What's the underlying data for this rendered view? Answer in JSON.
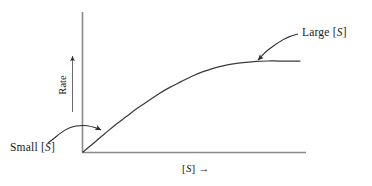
{
  "figure": {
    "name": "enzyme-kinetics-saturation-curve",
    "background_color": "#ffffff",
    "ink_color": "#3a3a3a",
    "text_color": "#1a1a1a"
  },
  "labels": {
    "y_axis": "Rate",
    "y_axis_arrow": "↑",
    "x_axis_prefix": "[",
    "x_axis_var": "S",
    "x_axis_suffix": "]",
    "x_axis_arrow": "→",
    "x_axis_full": "[S] →",
    "small_s": "Small [S]",
    "small_s_prefix": "Small  [",
    "small_s_var": "S",
    "small_s_suffix": "]",
    "large_s": "Large [S]",
    "large_s_prefix": "Large  [",
    "large_s_var": "S",
    "large_s_suffix": "]"
  },
  "annotations": [
    {
      "name": "small-s-annotation",
      "text": "Small [S]",
      "points_to": "initial linear region of curve near origin",
      "arrow_direction": "curves up and to the right"
    },
    {
      "name": "large-s-annotation",
      "text": "Large [S]",
      "points_to": "plateau region of curve at high substrate concentration",
      "arrow_direction": "curves down and to the left"
    }
  ],
  "chart_data": {
    "type": "line",
    "title": "",
    "subtitle": "",
    "xlabel": "[S] →",
    "ylabel": "Rate",
    "grid": false,
    "legend": false,
    "legend_position": "none",
    "axis_ticks": false,
    "axis_tick_labels": false,
    "xlim": [
      0,
      1
    ],
    "ylim": [
      0,
      1
    ],
    "series": [
      {
        "name": "Rate vs [S]",
        "color": "#3a3a3a",
        "x": [
          0.0,
          0.05,
          0.1,
          0.15,
          0.2,
          0.25,
          0.3,
          0.35,
          0.4,
          0.45,
          0.5,
          0.55,
          0.6,
          0.65,
          0.7,
          0.75,
          0.8,
          0.85,
          0.9,
          0.95,
          1.0
        ],
        "y": [
          0.0,
          0.1,
          0.2,
          0.3,
          0.39,
          0.48,
          0.56,
          0.64,
          0.71,
          0.77,
          0.83,
          0.88,
          0.92,
          0.95,
          0.97,
          0.985,
          0.995,
          1.0,
          1.0,
          1.0,
          1.0
        ]
      }
    ],
    "regions": [
      {
        "name": "linear-region",
        "label": "Small [S]",
        "x_range": [
          0.0,
          0.25
        ]
      },
      {
        "name": "plateau-region",
        "label": "Large [S]",
        "x_range": [
          0.72,
          1.0
        ]
      }
    ]
  }
}
